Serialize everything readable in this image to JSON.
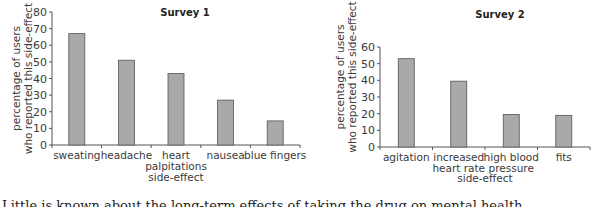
{
  "chart_data": [
    {
      "type": "bar",
      "title": "Survey 1",
      "xlabel": "side-effect",
      "ylabel": [
        "percentage of users",
        "who reported this side-effect"
      ],
      "categories": [
        [
          "sweating"
        ],
        [
          "headache"
        ],
        [
          "heart",
          "palpitations"
        ],
        [
          "nausea"
        ],
        [
          "blue fingers"
        ]
      ],
      "values": [
        67,
        51,
        43,
        27,
        14.5
      ],
      "ylim": [
        0,
        80
      ],
      "yticks": [
        0,
        10,
        20,
        30,
        40,
        50,
        60,
        70,
        80
      ],
      "grid": false,
      "bar_color": "#a9a9a9",
      "bar_edge": "#555555"
    },
    {
      "type": "bar",
      "title": "Survey 2",
      "xlabel": "side-effect",
      "ylabel": [
        "percentage of users",
        "who reported this side-effect"
      ],
      "categories": [
        [
          "agitation"
        ],
        [
          "increased",
          "heart rate"
        ],
        [
          "high blood",
          "pressure"
        ],
        [
          "fits"
        ]
      ],
      "values": [
        53,
        39.5,
        19.5,
        19
      ],
      "ylim": [
        0,
        60
      ],
      "yticks": [
        0,
        10,
        20,
        30,
        40,
        50,
        60
      ],
      "grid": false,
      "bar_color": "#a9a9a9",
      "bar_edge": "#555555"
    }
  ],
  "footer_text": "Little is known about the long-term effects of taking the drug on mental health."
}
